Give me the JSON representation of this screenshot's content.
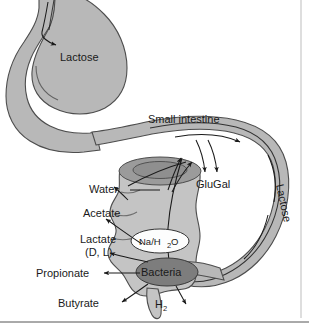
{
  "figure": {
    "background_color": "#ffffff",
    "organ_fill": "#b8b8b8",
    "organ_stroke": "#4d4d4d",
    "bacteria_fill": "#7d7d7d",
    "text_color": "#1a1a1a"
  },
  "labels": {
    "stomach_lactose": "Lactose",
    "small_intestine": "Small intestine",
    "glugal": "GluGal",
    "colon_lactose": "Lactose",
    "water": "Water",
    "acetate": "Acetate",
    "lactate": "Lactate",
    "lactate_isomers": "(D, L)",
    "propionate": "Propionate",
    "butyrate": "Butyrate",
    "hydrogen": "H",
    "hydrogen_sub": "2",
    "na_h2o_prefix": "Na/H",
    "na_h2o_sub": "2",
    "na_h2o_suffix": "O",
    "bacteria": "Bacteria"
  },
  "structures": [
    {
      "name": "esophagus",
      "label": ""
    },
    {
      "name": "stomach",
      "label": "Lactose"
    },
    {
      "name": "duodenum",
      "label": ""
    },
    {
      "name": "small-intestine",
      "label": "Small intestine"
    },
    {
      "name": "ileum",
      "label": ""
    },
    {
      "name": "colon",
      "label": ""
    },
    {
      "name": "cecum",
      "label": ""
    },
    {
      "name": "appendix",
      "label": ""
    }
  ],
  "metabolites": [
    {
      "name": "water",
      "label": "Water"
    },
    {
      "name": "acetate",
      "label": "Acetate"
    },
    {
      "name": "lactate",
      "label": "Lactate (D, L)"
    },
    {
      "name": "propionate",
      "label": "Propionate"
    },
    {
      "name": "butyrate",
      "label": "Butyrate"
    },
    {
      "name": "hydrogen",
      "label": "H2"
    },
    {
      "name": "glugal",
      "label": "GluGal"
    },
    {
      "name": "sodium-water",
      "label": "Na/H2O"
    }
  ]
}
